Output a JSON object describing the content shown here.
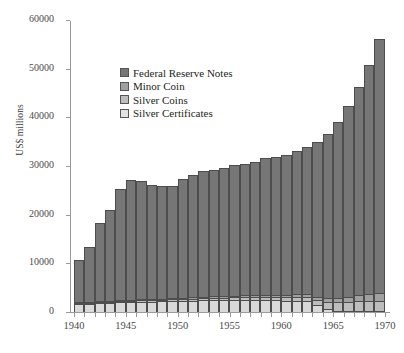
{
  "chart_data": {
    "type": "bar",
    "stacked": true,
    "title": "",
    "xlabel": "",
    "ylabel": "US$ millions",
    "ylim": [
      0,
      60000
    ],
    "ytick_values": [
      0,
      10000,
      20000,
      30000,
      40000,
      50000,
      60000
    ],
    "ytick_labels": [
      "0",
      "10000",
      "20000",
      "30000",
      "40000",
      "50000",
      "60000"
    ],
    "xtick_labels": [
      "1940",
      "1945",
      "1950",
      "1955",
      "1960",
      "1965",
      "1970"
    ],
    "xtick_values": [
      1940,
      1945,
      1950,
      1955,
      1960,
      1965,
      1970
    ],
    "xlim": [
      1940,
      1970
    ],
    "grid": false,
    "legend_position": "upper-left-inside",
    "categories": [
      1941,
      1942,
      1943,
      1944,
      1945,
      1946,
      1947,
      1948,
      1949,
      1950,
      1951,
      1952,
      1953,
      1954,
      1955,
      1956,
      1957,
      1958,
      1959,
      1960,
      1961,
      1962,
      1963,
      1964,
      1965,
      1966,
      1967,
      1968,
      1969,
      1970
    ],
    "series": [
      {
        "name": "Silver Certificates",
        "color": "#d9d9d9",
        "values": [
          1600,
          1700,
          1800,
          1900,
          2000,
          2050,
          2100,
          2150,
          2200,
          2250,
          2300,
          2350,
          2400,
          2420,
          2440,
          2450,
          2460,
          2450,
          2430,
          2400,
          2350,
          2300,
          2200,
          1400,
          700,
          300,
          150,
          80,
          40,
          20
        ]
      },
      {
        "name": "Silver Coins",
        "color": "#bdbdbd",
        "values": [
          180,
          200,
          220,
          240,
          260,
          280,
          300,
          320,
          340,
          360,
          390,
          420,
          450,
          480,
          510,
          540,
          580,
          620,
          660,
          710,
          780,
          860,
          960,
          1150,
          1450,
          1750,
          1950,
          2050,
          2100,
          2150
        ]
      },
      {
        "name": "Minor Coin",
        "color": "#a0a0a0",
        "values": [
          120,
          140,
          160,
          180,
          200,
          210,
          220,
          230,
          240,
          250,
          265,
          280,
          295,
          310,
          325,
          340,
          360,
          380,
          400,
          425,
          455,
          490,
          530,
          580,
          680,
          820,
          980,
          1150,
          1320,
          1500
        ]
      },
      {
        "name": "Federal Reserve Notes",
        "color": "#767676",
        "values": [
          8700,
          11300,
          16100,
          18700,
          22800,
          24600,
          24300,
          23500,
          23200,
          23100,
          24300,
          25200,
          25900,
          26000,
          26300,
          26900,
          27100,
          27400,
          28200,
          28300,
          28700,
          29400,
          30300,
          31800,
          33800,
          36200,
          39300,
          42900,
          47200,
          52300
        ]
      }
    ]
  },
  "axis": {
    "y_title": "US$ millions"
  },
  "legend": {
    "items": [
      {
        "label": "Federal Reserve Notes",
        "color": "#767676"
      },
      {
        "label": "Minor Coin",
        "color": "#a0a0a0"
      },
      {
        "label": "Silver Coins",
        "color": "#bdbdbd"
      },
      {
        "label": "Silver Certificates",
        "color": "#e2e2e2"
      }
    ]
  }
}
